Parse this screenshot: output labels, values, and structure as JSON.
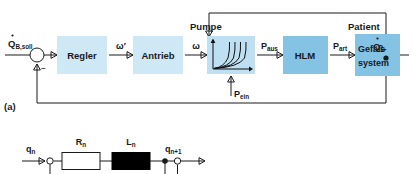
{
  "figure": {
    "panel_a_label": "(a)"
  },
  "colors": {
    "block_light": "#cfe8f5",
    "block_strong": "#84c3e3",
    "pump_fill": "#bfe0f2",
    "line": "#1a1a1a",
    "resistor_fill": "#ffffff",
    "inductor_fill": "#000000"
  },
  "block_diagram": {
    "blocks": [
      {
        "id": "regler",
        "label": "Regler",
        "shade": "light"
      },
      {
        "id": "antrieb",
        "label": "Antrieb",
        "shade": "light"
      },
      {
        "id": "pumpe",
        "label": "",
        "shade": "pump"
      },
      {
        "id": "hlm",
        "label": "HLM",
        "shade": "strong"
      },
      {
        "id": "gefaess",
        "label_line1": "Gefäß-",
        "label_line2": "system",
        "shade": "strong"
      }
    ],
    "group_labels": [
      {
        "id": "pumpe-title",
        "text": "Pumpe"
      },
      {
        "id": "patient-title",
        "text": "Patient"
      }
    ],
    "signals": [
      {
        "id": "input",
        "base": "Q",
        "sub": "B,soll",
        "dot": true
      },
      {
        "id": "omega-pre",
        "base": "ω′",
        "sub": "",
        "dot": false
      },
      {
        "id": "omega",
        "base": "ω",
        "sub": "",
        "dot": false
      },
      {
        "id": "p-aus",
        "base": "P",
        "sub": "aus",
        "dot": false
      },
      {
        "id": "p-art",
        "base": "P",
        "sub": "art",
        "dot": false
      },
      {
        "id": "p-ein",
        "base": "P",
        "sub": "ein",
        "dot": false
      },
      {
        "id": "output",
        "base": "Q",
        "sub": "B",
        "dot": true
      }
    ],
    "summing_junction": {
      "sign": "–"
    },
    "pump_curve": {
      "curve_count": 4
    }
  },
  "circuit_diagram": {
    "elements": [
      {
        "id": "resistor",
        "label_base": "R",
        "label_sub": "n",
        "type": "resistor"
      },
      {
        "id": "inductor",
        "label_base": "L",
        "label_sub": "n",
        "type": "inductor"
      }
    ],
    "terminals": [
      {
        "id": "q-in",
        "base": "q",
        "sub": "n"
      },
      {
        "id": "q-out",
        "base": "q",
        "sub": "n+1"
      }
    ]
  }
}
